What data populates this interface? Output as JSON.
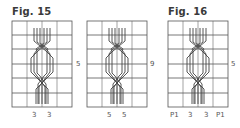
{
  "figures": [
    {
      "title": "Fig. 15",
      "charts": [
        {
          "grid": {
            "cols": 4,
            "rows": 6
          },
          "row_label": "5",
          "bottom_labels": [
            "3",
            "3"
          ]
        },
        {
          "grid": {
            "cols": 4,
            "rows": 6
          },
          "row_label": "9",
          "bottom_labels": [
            "5",
            "5"
          ]
        }
      ]
    },
    {
      "title": "Fig. 16",
      "charts": [
        {
          "grid": {
            "cols": 4,
            "rows": 6
          },
          "row_label": "5",
          "bottom_labels": [
            "P1",
            "3",
            "3",
            "P1"
          ]
        }
      ]
    }
  ],
  "colors": {
    "grid": "#555555",
    "cable": "#444444",
    "text": "#3a3a3a"
  }
}
